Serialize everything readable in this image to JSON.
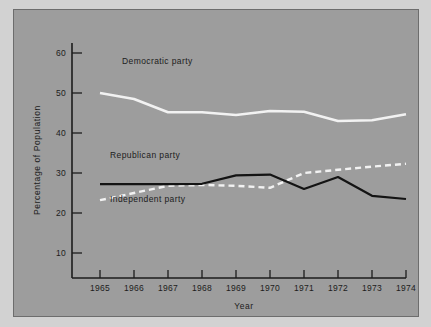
{
  "chart_data": {
    "type": "line",
    "title": "",
    "xlabel": "Year",
    "ylabel": "Percentage of Population",
    "categories": [
      1965,
      1966,
      1967,
      1968,
      1969,
      1970,
      1971,
      1972,
      1973,
      1974
    ],
    "xtick_labels": [
      "1965",
      "1966",
      "1967",
      "1968",
      "1969",
      "1970",
      "1971",
      "1972",
      "1973",
      "1974"
    ],
    "ytick_labels": [
      "10",
      "20",
      "30",
      "40",
      "50",
      "60"
    ],
    "ytick_values": [
      10,
      20,
      30,
      40,
      50,
      60
    ],
    "xlim": [
      1965,
      1974
    ],
    "ylim": [
      0,
      64
    ],
    "grid": false,
    "legend_position": "inline-annotations",
    "series": [
      {
        "name": "Democratic party",
        "style": "solid",
        "color": "#f2f2f2",
        "values": [
          50.0,
          48.5,
          45.2,
          45.2,
          44.5,
          45.5,
          45.3,
          43.0,
          43.2,
          44.7
        ]
      },
      {
        "name": "Republican party",
        "style": "solid",
        "color": "#141414",
        "values": [
          27.2,
          27.2,
          27.2,
          27.3,
          29.4,
          29.6,
          26.0,
          29.0,
          24.3,
          23.5
        ]
      },
      {
        "name": "Independent party",
        "style": "dashed",
        "color": "#f2f2f2",
        "values": [
          23.2,
          25.0,
          26.8,
          27.0,
          26.8,
          26.3,
          30.0,
          30.8,
          31.6,
          32.3
        ]
      }
    ],
    "annotations": [
      {
        "text": "Democratic party",
        "x": 1966.1,
        "y": 53.0
      },
      {
        "text": "Republican party",
        "x": 1965.6,
        "y": 30.4
      },
      {
        "text": "Independent party",
        "x": 1965.6,
        "y": 21.0
      }
    ]
  },
  "colors": {
    "figure_background": "#d2d2d2",
    "panel_background": "#9d9d9d",
    "panel_border": "#6d6d6d",
    "axis": "#1c1c1c",
    "text": "#1c1c1c"
  }
}
